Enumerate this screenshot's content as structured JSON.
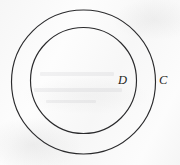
{
  "figure": {
    "kind": "geometry-diagram",
    "background_color": "#fafafa",
    "stroke_color": "#2a2a2c",
    "labels": {
      "inner_circle": "D",
      "outer_circle": "C"
    },
    "shapes": [
      {
        "name": "outer-circle",
        "label": "C",
        "cx": 83.5,
        "cy": 82,
        "r": 72,
        "stroke_width": 1.15
      },
      {
        "name": "inner-circle",
        "label": "D",
        "cx": 83.5,
        "cy": 80.5,
        "r": 53,
        "stroke_width": 1.15
      }
    ],
    "label_positions": {
      "inner": {
        "x": 122,
        "y": 81
      },
      "outer": {
        "x": 163,
        "y": 81
      }
    }
  }
}
